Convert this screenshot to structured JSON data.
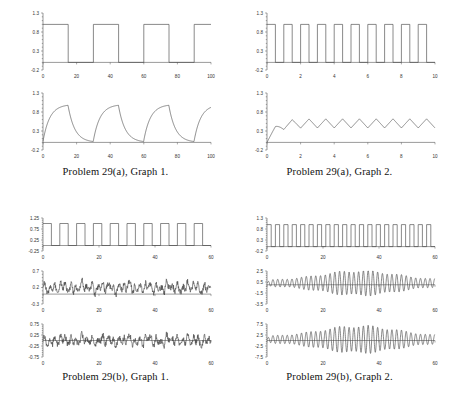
{
  "page": {
    "background_color": "#ffffff",
    "ink_color": "#4a4a4a"
  },
  "panels": [
    {
      "id": "panel-29a-graph-1",
      "caption": "Problem 29(a), Graph 1.",
      "charts": [
        {
          "name": "square-input-29a-1",
          "type": "line",
          "title": "",
          "xlabel": "",
          "ylabel": "",
          "xlim": [
            0,
            100
          ],
          "ylim": [
            -0.2,
            1.3
          ],
          "xticks": [
            0,
            20,
            40,
            60,
            80,
            100
          ],
          "yticks": [
            -0.2,
            0.3,
            0.8,
            1.3
          ],
          "xticklabels": [
            "0",
            "20",
            "40",
            "60",
            "80",
            "100"
          ],
          "yticklabels": [
            "-0.2",
            "0.3",
            "0.8",
            "1.3"
          ],
          "grid": false,
          "waveform": "square",
          "period": 30,
          "duty": 0.5,
          "high": 1.0,
          "low": 0.0,
          "phase_start": "high"
        },
        {
          "name": "filtered-output-29a-1",
          "type": "line",
          "title": "",
          "xlabel": "",
          "ylabel": "",
          "xlim": [
            0,
            100
          ],
          "ylim": [
            -0.2,
            1.3
          ],
          "xticks": [
            0,
            20,
            40,
            60,
            80,
            100
          ],
          "yticks": [
            -0.2,
            0.3,
            0.8,
            1.3
          ],
          "xticklabels": [
            "0",
            "20",
            "40",
            "60",
            "80",
            "100"
          ],
          "yticklabels": [
            "-0.2",
            "0.3",
            "0.8",
            "1.3"
          ],
          "grid": false,
          "waveform": "smoothed-square",
          "period": 30,
          "duty": 0.5,
          "high": 1.0,
          "low": 0.0,
          "rise_time": 4.0,
          "phase_start": "high"
        }
      ]
    },
    {
      "id": "panel-29a-graph-2",
      "caption": "Problem 29(a), Graph 2.",
      "charts": [
        {
          "name": "square-input-29a-2",
          "type": "line",
          "title": "",
          "xlabel": "",
          "ylabel": "",
          "xlim": [
            0,
            10
          ],
          "ylim": [
            -0.2,
            1.3
          ],
          "xticks": [
            0,
            2,
            4,
            6,
            8,
            10
          ],
          "yticks": [
            -0.2,
            0.3,
            0.8,
            1.3
          ],
          "xticklabels": [
            "0",
            "2",
            "4",
            "6",
            "8",
            "10"
          ],
          "yticklabels": [
            "-0.2",
            "0.3",
            "0.8",
            "1.3"
          ],
          "grid": false,
          "waveform": "square",
          "period": 1.0,
          "duty": 0.5,
          "high": 1.0,
          "low": 0.0,
          "phase_start": "high"
        },
        {
          "name": "ripple-output-29a-2",
          "type": "line",
          "title": "",
          "xlabel": "",
          "ylabel": "",
          "xlim": [
            0,
            10
          ],
          "ylim": [
            -0.2,
            1.3
          ],
          "xticks": [
            0,
            2,
            4,
            6,
            8,
            10
          ],
          "yticks": [
            -0.2,
            0.3,
            0.8,
            1.3
          ],
          "xticklabels": [
            "0",
            "2",
            "4",
            "6",
            "8",
            "10"
          ],
          "yticklabels": [
            "-0.2",
            "0.3",
            "0.8",
            "1.3"
          ],
          "grid": false,
          "waveform": "triangular-ripple",
          "period": 1.0,
          "mean_level": 0.5,
          "ripple_amplitude": 0.12,
          "settling_start": 0.0
        }
      ]
    },
    {
      "id": "panel-29b-graph-1",
      "caption": "Problem 29(b), Graph 1.",
      "charts": [
        {
          "name": "square-input-29b-1",
          "type": "line",
          "title": "",
          "xlabel": "",
          "ylabel": "",
          "xlim": [
            0,
            60
          ],
          "ylim": [
            -0.25,
            1.25
          ],
          "xticks": [
            0,
            20,
            40,
            60
          ],
          "yticks": [
            -0.25,
            0.25,
            0.75,
            1.25
          ],
          "xticklabels": [
            "0",
            "20",
            "40",
            "60"
          ],
          "yticklabels": [
            "-0.25",
            "0.25",
            "0.75",
            "1.25"
          ],
          "grid": false,
          "waveform": "square",
          "period": 6,
          "duty": 0.5,
          "high": 1.0,
          "low": 0.0,
          "phase_start": "high"
        },
        {
          "name": "noisy-output-29b-1-upper",
          "type": "line",
          "title": "",
          "xlabel": "",
          "ylabel": "",
          "xlim": [
            0,
            60
          ],
          "ylim": [
            -0.3,
            0.7
          ],
          "xticks": [
            0,
            20,
            40,
            60
          ],
          "yticks": [
            -0.3,
            0.2,
            0.7
          ],
          "xticklabels": [
            "0",
            "20",
            "40",
            "60"
          ],
          "yticklabels": [
            "-0.3",
            "0.2",
            "0.7"
          ],
          "grid": false,
          "waveform": "noisy-oscillation",
          "mean_level": 0.2,
          "amplitude": 0.35
        },
        {
          "name": "noisy-output-29b-1-lower",
          "type": "line",
          "title": "",
          "xlabel": "",
          "ylabel": "",
          "xlim": [
            0,
            60
          ],
          "ylim": [
            -0.75,
            0.75
          ],
          "xticks": [
            0,
            20,
            40,
            60
          ],
          "yticks": [
            -0.75,
            -0.25,
            0.25,
            0.75
          ],
          "xticklabels": [
            "0",
            "20",
            "40",
            "60"
          ],
          "yticklabels": [
            "-0.75",
            "-0.25",
            "0.25",
            "0.75"
          ],
          "grid": false,
          "waveform": "noisy-oscillation",
          "mean_level": 0.0,
          "amplitude": 0.5
        }
      ]
    },
    {
      "id": "panel-29b-graph-2",
      "caption": "Problem 29(b), Graph 2.",
      "charts": [
        {
          "name": "square-input-29b-2",
          "type": "line",
          "title": "",
          "xlabel": "",
          "ylabel": "",
          "xlim": [
            0,
            60
          ],
          "ylim": [
            -0.2,
            1.3
          ],
          "xticks": [
            0,
            20,
            40,
            60
          ],
          "yticks": [
            -0.2,
            0.3,
            0.8,
            1.3
          ],
          "xticklabels": [
            "0",
            "20",
            "40",
            "60"
          ],
          "yticklabels": [
            "-0.2",
            "0.3",
            "0.8",
            "1.3"
          ],
          "grid": false,
          "waveform": "square",
          "period": 3,
          "duty": 0.5,
          "high": 1.0,
          "low": 0.0,
          "phase_start": "high"
        },
        {
          "name": "beating-output-29b-2-upper",
          "type": "line",
          "title": "",
          "xlabel": "",
          "ylabel": "",
          "xlim": [
            0,
            60
          ],
          "ylim": [
            -3.5,
            2.5
          ],
          "xticks": [
            0,
            20,
            40,
            60
          ],
          "yticks": [
            -3.5,
            -1.5,
            0.5,
            2.5
          ],
          "xticklabels": [
            "0",
            "20",
            "40",
            "60"
          ],
          "yticklabels": [
            "-3.5",
            "-1.5",
            "0.5",
            "2.5"
          ],
          "grid": false,
          "waveform": "beating-oscillation",
          "carrier_period": 1.7,
          "envelope_peak_x": 33,
          "envelope_max": 2.2,
          "mean_level": 0.3
        },
        {
          "name": "beating-output-29b-2-lower",
          "type": "line",
          "title": "",
          "xlabel": "",
          "ylabel": "",
          "xlim": [
            0,
            60
          ],
          "ylim": [
            -7.5,
            7.5
          ],
          "xticks": [
            0,
            20,
            40,
            60
          ],
          "yticks": [
            -7.5,
            -2.5,
            2.5,
            7.5
          ],
          "xticklabels": [
            "0",
            "20",
            "40",
            "60"
          ],
          "yticklabels": [
            "-7.5",
            "-2.5",
            "2.5",
            "7.5"
          ],
          "grid": false,
          "waveform": "beating-oscillation",
          "carrier_period": 1.7,
          "envelope_peak_x": 33,
          "envelope_max": 6.0,
          "mean_level": 0.5
        }
      ]
    }
  ]
}
